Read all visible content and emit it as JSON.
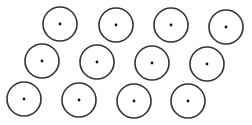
{
  "canvas": {
    "width": 252,
    "height": 125,
    "background": "#ffffff"
  },
  "style": {
    "stroke_color": "#333333",
    "stroke_width": 1.6,
    "dot_color": "#111111",
    "dot_radius": 1.4,
    "circle_radius": 17
  },
  "circles": [
    {
      "cx": 60,
      "cy": 24
    },
    {
      "cx": 116,
      "cy": 25
    },
    {
      "cx": 171,
      "cy": 25
    },
    {
      "cx": 226,
      "cy": 27
    },
    {
      "cx": 42,
      "cy": 61
    },
    {
      "cx": 97,
      "cy": 62
    },
    {
      "cx": 152,
      "cy": 63
    },
    {
      "cx": 207,
      "cy": 64
    },
    {
      "cx": 24,
      "cy": 99
    },
    {
      "cx": 79,
      "cy": 100
    },
    {
      "cx": 134,
      "cy": 101
    },
    {
      "cx": 188,
      "cy": 101
    }
  ]
}
